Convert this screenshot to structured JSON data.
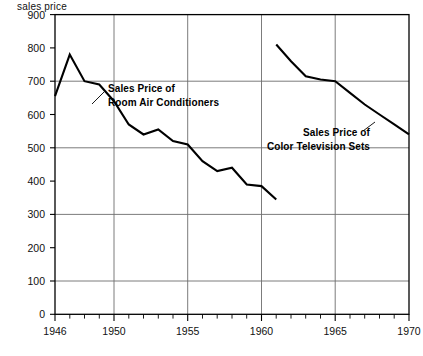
{
  "chart_data": {
    "type": "line",
    "title": "",
    "ylabel": "sales price",
    "xlabel": "",
    "ylim": [
      0,
      900
    ],
    "xlim": [
      1946,
      1970
    ],
    "grid": true,
    "grid_y_values": [
      200,
      400,
      600,
      800
    ],
    "grid_x_values": [
      1950,
      1955,
      1960,
      1965
    ],
    "ytick_labels": [
      "0",
      "100",
      "200",
      "300",
      "400",
      "500",
      "600",
      "700",
      "800",
      "900"
    ],
    "ytick_values": [
      0,
      100,
      200,
      300,
      400,
      500,
      600,
      700,
      800,
      900
    ],
    "xtick_labels": [
      "1946",
      "1950",
      "1955",
      "1960",
      "1965",
      "1970"
    ],
    "xtick_values": [
      1946,
      1950,
      1955,
      1960,
      1965,
      1970
    ],
    "legend_position": "inline-annotations",
    "series": [
      {
        "name": "Sales Price of Room Air Conditioners",
        "x": [
          1946,
          1947,
          1948,
          1949,
          1950,
          1951,
          1952,
          1953,
          1954,
          1955,
          1956,
          1957,
          1958,
          1959,
          1960,
          1961
        ],
        "values": [
          655,
          780,
          700,
          690,
          640,
          570,
          540,
          555,
          520,
          510,
          460,
          430,
          440,
          390,
          385,
          345
        ]
      },
      {
        "name": "Sales Price of Color Television Sets",
        "x": [
          1961,
          1962,
          1963,
          1964,
          1965,
          1966,
          1967,
          1968,
          1969,
          1970
        ],
        "values": [
          810,
          760,
          715,
          705,
          700,
          665,
          630,
          600,
          570,
          540
        ]
      }
    ],
    "annotations": [
      {
        "id": "annotation-air-conditioners",
        "line1": "Sales Price of",
        "line2": "Room Air Conditioners",
        "text_x": 108,
        "text_y": 89,
        "leader": [
          [
            104,
            92
          ],
          [
            92,
            104
          ]
        ]
      },
      {
        "id": "annotation-television",
        "line1": "Sales Price of",
        "line2": "Color Television Sets",
        "text_x": 272,
        "text_y": 134,
        "leader": [
          [
            363,
            131
          ],
          [
            375,
            122
          ]
        ]
      }
    ]
  }
}
